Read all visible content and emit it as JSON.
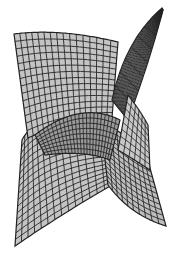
{
  "figure": {
    "background_color": "#ffffff",
    "fill_color": "#c4c4c4",
    "shade_color": "#9a9a9a",
    "line_color": "#222222"
  },
  "lobes": [
    {
      "name": "top-left-fan",
      "label": ""
    },
    {
      "name": "top-right-spike",
      "label": ""
    },
    {
      "name": "bottom-left-lobe",
      "label": ""
    },
    {
      "name": "bottom-right-lobe",
      "label": ""
    }
  ]
}
